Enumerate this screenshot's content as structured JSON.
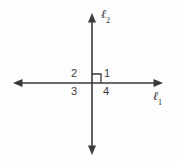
{
  "diagram": {
    "background_color": "#fdfdfd",
    "stroke_color": "#3a3a3a",
    "label_color": "#3a3a3a",
    "lines": [
      {
        "id": "l1",
        "label": "ℓ",
        "subscript": "1",
        "orientation": "horizontal",
        "arrowheads": "both",
        "x_start": 13,
        "x_end": 163,
        "y": 83
      },
      {
        "id": "l2",
        "label": "ℓ",
        "subscript": "2",
        "orientation": "vertical",
        "arrowheads": "both",
        "y_start": 13,
        "y_end": 155,
        "x": 92
      }
    ],
    "intersection": {
      "x": 92,
      "y": 83
    },
    "right_angle_marker": {
      "quadrant": "upper-right",
      "size": 9,
      "present": true
    },
    "angle_labels": [
      {
        "id": "1",
        "text": "1",
        "quadrant": "upper-right"
      },
      {
        "id": "2",
        "text": "2",
        "quadrant": "upper-left"
      },
      {
        "id": "3",
        "text": "3",
        "quadrant": "lower-left"
      },
      {
        "id": "4",
        "text": "4",
        "quadrant": "lower-right"
      }
    ]
  }
}
